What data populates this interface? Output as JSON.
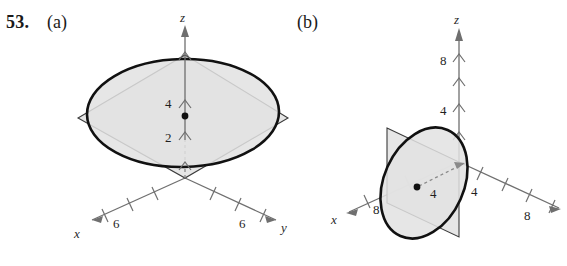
{
  "exercise": {
    "number": "53.",
    "parts": [
      {
        "id": "a",
        "label": "(a)"
      },
      {
        "id": "b",
        "label": "(b)"
      }
    ]
  },
  "figures": {
    "a": {
      "axes": {
        "x": {
          "letter": "x",
          "tick_labels": [
            "6"
          ],
          "tick_count": 3
        },
        "y": {
          "letter": "y",
          "tick_labels": [
            "6"
          ],
          "tick_count": 3
        },
        "z": {
          "letter": "z",
          "tick_labels": [
            "4",
            "2"
          ],
          "tick_count": 4
        }
      },
      "annotations": {
        "center_dot": "center-point",
        "z_upper_label": "4",
        "z_lower_label": "2"
      },
      "shapes": {
        "plane": "diamond-plane",
        "curve": "ellipse-trace"
      }
    },
    "b": {
      "axes": {
        "x": {
          "letter": "x",
          "tick_labels": [
            "8"
          ],
          "tick_count": 2
        },
        "y": {
          "letter": "y",
          "tick_labels": [
            "4",
            "8"
          ],
          "tick_count": 4
        },
        "z": {
          "letter": "z",
          "tick_labels": [
            "4",
            "8"
          ],
          "tick_count": 4
        }
      },
      "annotations": {
        "center_dot": "center-point",
        "radius_label": "4"
      },
      "shapes": {
        "plane": "vertical-plane",
        "curve": "ellipse-trace"
      }
    }
  },
  "colors": {
    "plane_fill": "#e4e4e4",
    "curve_stroke": "#111111",
    "axis_stroke": "#6f6f6f",
    "text": "#1a1a1a"
  }
}
